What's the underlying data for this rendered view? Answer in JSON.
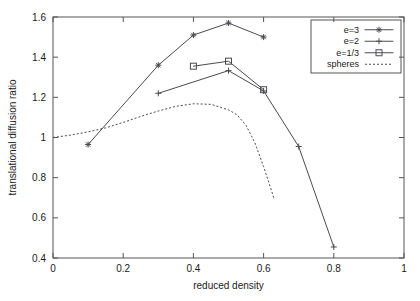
{
  "chart_data": {
    "type": "line",
    "title": "",
    "subtitle": "",
    "xlabel": "reduced density",
    "ylabel": "translational diffusion ratio",
    "xlim": [
      0,
      1
    ],
    "ylim": [
      0.4,
      1.6
    ],
    "xticks": [
      "0",
      "0.2",
      "0.4",
      "0.6",
      "0.8",
      "1"
    ],
    "xtick_values": [
      0,
      0.2,
      0.4,
      0.6,
      0.8,
      1
    ],
    "yticks": [
      "0.4",
      "0.6",
      "0.8",
      "1",
      "1.2",
      "1.4",
      "1.6"
    ],
    "ytick_values": [
      0.4,
      0.6,
      0.8,
      1.0,
      1.2,
      1.4,
      1.6
    ],
    "grid": false,
    "legend_position": "top-right",
    "series": [
      {
        "name": "e=3",
        "marker": "star",
        "style": "solid",
        "x": [
          0.1,
          0.3,
          0.4,
          0.5,
          0.6
        ],
        "y": [
          0.965,
          1.36,
          1.51,
          1.57,
          1.5
        ]
      },
      {
        "name": "e=2",
        "marker": "plus",
        "style": "solid",
        "x": [
          0.3,
          0.5,
          0.6,
          0.7,
          0.8
        ],
        "y": [
          1.22,
          1.333,
          1.232,
          0.955,
          0.455
        ]
      },
      {
        "name": "e=1/3",
        "marker": "square",
        "style": "solid",
        "x": [
          0.4,
          0.5,
          0.6
        ],
        "y": [
          1.355,
          1.38,
          1.238
        ]
      },
      {
        "name": "spheres",
        "marker": "none",
        "style": "dashed",
        "x": [
          0.0,
          0.05,
          0.1,
          0.15,
          0.2,
          0.25,
          0.3,
          0.35,
          0.4,
          0.45,
          0.5,
          0.525,
          0.55,
          0.575,
          0.6,
          0.615,
          0.63
        ],
        "y": [
          1.0,
          1.012,
          1.028,
          1.048,
          1.075,
          1.105,
          1.132,
          1.155,
          1.168,
          1.165,
          1.138,
          1.112,
          1.06,
          0.975,
          0.855,
          0.775,
          0.695
        ]
      }
    ],
    "legend": [
      {
        "label": "e=3",
        "marker": "star",
        "style": "solid"
      },
      {
        "label": "e=2",
        "marker": "plus",
        "style": "solid"
      },
      {
        "label": "e=1/3",
        "marker": "square",
        "style": "solid"
      },
      {
        "label": "spheres",
        "marker": "none",
        "style": "dashed"
      }
    ],
    "colors": {
      "line": "#4a4a52",
      "axis": "#555555",
      "text": "#1a1a1a",
      "background": "#ffffff"
    }
  }
}
